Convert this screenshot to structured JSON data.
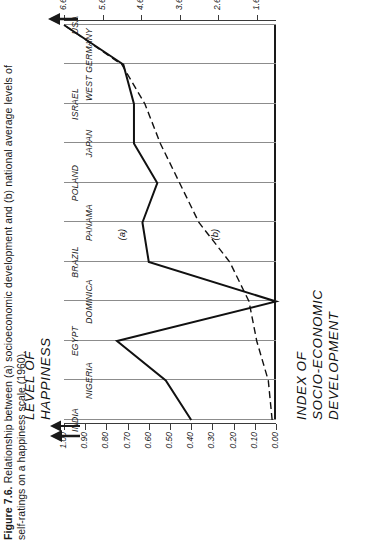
{
  "caption": {
    "figure_number": "Figure 7.6.",
    "line1": "Relationship between (a) socioeconomic development and (b) national average levels of",
    "line2": "self-ratings on a happiness scale (1960)."
  },
  "axis_titles": {
    "value_left_line1": "INDEX  OF",
    "value_left_line2": "SOCIO-ECONOMIC",
    "value_left_line3": "DEVELOPMENT",
    "value_right_line1": "LEVEL  OF",
    "value_right_line2": "HAPPINESS"
  },
  "series_labels": {
    "a": "(a)",
    "b": "(b)"
  },
  "chart_data": {
    "type": "line",
    "title": "Relationship between (a) socioeconomic development and (b) national average levels of self-ratings on a happiness scale (1960).",
    "orientation": "rotated-90-ccw",
    "grid": true,
    "legend": "inline-annotations",
    "categories": [
      "INDIA",
      "NIGERIA",
      "EGYPT",
      "DOMINICA",
      "BRAZIL",
      "PANAMA",
      "POLAND",
      "JAPAN",
      "ISRAEL",
      "WEST GERMANY",
      "USA"
    ],
    "xlabel": "",
    "series": [
      {
        "name": "(a) Index of socio-economic development",
        "axis": "left",
        "ylabel": "INDEX OF SOCIO-ECONOMIC DEVELOPMENT",
        "ylim": [
          0.0,
          1.0
        ],
        "yticks": [
          "1.00",
          "0.90",
          "0.80",
          "0.70",
          "0.60",
          "0.50",
          "0.40",
          "0.30",
          "0.20",
          "0.10",
          "0.00"
        ],
        "ytick_values": [
          1.0,
          0.9,
          0.8,
          0.7,
          0.6,
          0.5,
          0.4,
          0.3,
          0.2,
          0.1,
          0.0
        ],
        "values": [
          0.4,
          0.52,
          0.75,
          0.0,
          0.6,
          0.63,
          0.56,
          0.67,
          0.67,
          0.72,
          1.0
        ]
      },
      {
        "name": "(b) Level of happiness",
        "axis": "right",
        "ylabel": "LEVEL OF HAPPINESS",
        "ylim": [
          1.1,
          6.6
        ],
        "yticks": [
          "6.6",
          "5.6",
          "4.6",
          "3.6",
          "2.6",
          "1.6"
        ],
        "ytick_values": [
          6.6,
          5.6,
          4.6,
          3.6,
          2.6,
          1.6
        ],
        "values": [
          1.2,
          1.3,
          1.6,
          1.8,
          2.3,
          3.1,
          3.6,
          4.1,
          4.5,
          5.1,
          6.6
        ]
      }
    ]
  }
}
